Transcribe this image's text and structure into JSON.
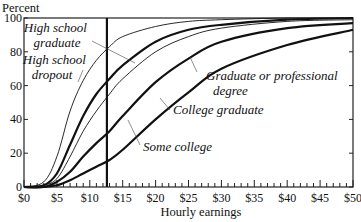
{
  "chart_data": {
    "type": "line",
    "title": "",
    "xlabel": "Hourly earnings",
    "ylabel": "Percent",
    "xlim": [
      0,
      50
    ],
    "ylim": [
      0,
      100
    ],
    "grid": false,
    "legend": "inline labels with leader lines",
    "x_ticks": [
      0,
      5,
      10,
      15,
      20,
      25,
      30,
      35,
      40,
      45,
      50
    ],
    "x_tick_labels": [
      "$0",
      "$5",
      "$10",
      "$15",
      "$20",
      "$25",
      "$30",
      "$35",
      "$40",
      "$45",
      "$50"
    ],
    "x_minor_tick_step": 1,
    "y_ticks": [
      0,
      20,
      40,
      60,
      80,
      100
    ],
    "y_tick_labels": [
      "0",
      "20",
      "40",
      "60",
      "80",
      "100"
    ],
    "reference_line": {
      "orientation": "vertical",
      "x": 12.6
    },
    "x": [
      0,
      3,
      5,
      7,
      9,
      11,
      13,
      15,
      20,
      25,
      30,
      40,
      50
    ],
    "series": [
      {
        "name": "High school dropout",
        "weight": "thin",
        "label_lines": [
          "High school",
          "dropout"
        ],
        "values": [
          0,
          3,
          18,
          45,
          63,
          75,
          83,
          89,
          95,
          98,
          99,
          100,
          100
        ]
      },
      {
        "name": "High school graduate",
        "weight": "thick",
        "label_lines": [
          "High school",
          "graduate"
        ],
        "values": [
          0,
          1,
          8,
          25,
          42,
          55,
          64,
          72,
          86,
          93,
          96,
          99,
          100
        ]
      },
      {
        "name": "Some college",
        "weight": "thin",
        "label_lines": [
          "Some college"
        ],
        "values": [
          0,
          1,
          5,
          18,
          33,
          45,
          55,
          64,
          80,
          89,
          94,
          98,
          99
        ]
      },
      {
        "name": "College graduate",
        "weight": "thick",
        "label_lines": [
          "College graduate"
        ],
        "values": [
          0,
          0,
          3,
          9,
          18,
          26,
          33,
          42,
          62,
          76,
          86,
          94,
          97
        ]
      },
      {
        "name": "Graduate or professional degree",
        "weight": "thick",
        "label_lines": [
          "Graduate or professional",
          "degree"
        ],
        "values": [
          0,
          0,
          1,
          4,
          8,
          12,
          16,
          22,
          40,
          56,
          70,
          84,
          93
        ]
      }
    ]
  }
}
